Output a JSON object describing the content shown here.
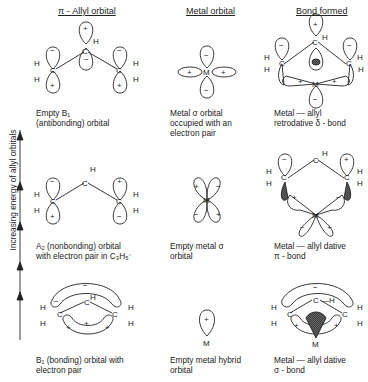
{
  "headers": {
    "col1": "π - Allyl orbital",
    "col2": "Metal orbital",
    "col3": "Bond formed"
  },
  "axis_label": "Increasing energy of allyl orbitals",
  "rows": [
    {
      "allyl_caption": "Empty B₁\n(antibonding) orbital",
      "metal_caption": "Metal σ orbital\noccupied with an\nelectron pair",
      "bond_caption": "Metal — allyl\nretrodative δ - bond",
      "allyl_signs": [
        "−",
        "+",
        "+",
        "−",
        "−",
        "+"
      ],
      "metal_signs": [
        "−",
        "+",
        "+",
        "−"
      ],
      "metal_label": "M"
    },
    {
      "allyl_caption": "A₂ (nonbonding) orbital\nwith electron pair in C₃H₅⁻",
      "metal_caption": "Empty metal σ\norbital",
      "bond_caption": "Metal — allyl dative\nπ - bond",
      "allyl_signs": [
        "−",
        "+",
        "+",
        "−"
      ],
      "metal_signs": [
        "+",
        "−",
        "−",
        "+"
      ],
      "metal_label": "M"
    },
    {
      "allyl_caption": "B₁ (bonding) orbital with\nelectron pair",
      "metal_caption": "Empty metal hybrid\norbital",
      "bond_caption": "Metal — allyl dative\nσ - bond",
      "allyl_signs": [
        "−",
        "+"
      ],
      "metal_signs": [
        "+"
      ],
      "metal_label": "M"
    }
  ],
  "atoms": {
    "carbon": "C",
    "hydrogen": "H",
    "metal": "M"
  }
}
